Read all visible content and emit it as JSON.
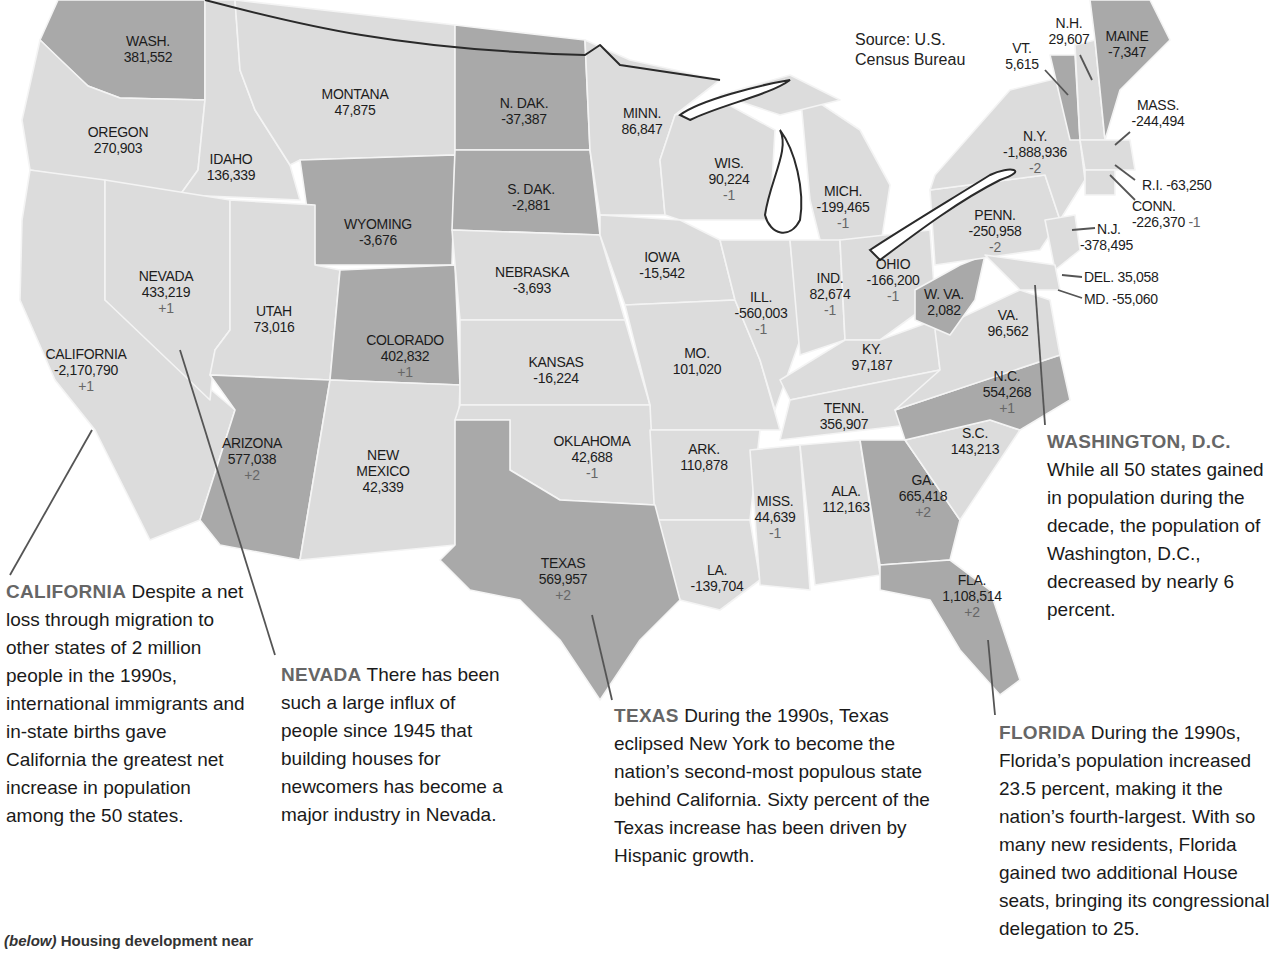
{
  "source": [
    "Source: U.S.",
    "Census Bureau"
  ],
  "colors": {
    "light_state": "#dcdcdc",
    "dark_state": "#a9a9a9",
    "caption_heading": "#666666",
    "seat_change": "#666666"
  },
  "states": [
    {
      "name": "WASH.",
      "value": "381,552",
      "seats": ""
    },
    {
      "name": "OREGON",
      "value": "270,903",
      "seats": ""
    },
    {
      "name": "IDAHO",
      "value": "136,339",
      "seats": ""
    },
    {
      "name": "MONTANA",
      "value": "47,875",
      "seats": ""
    },
    {
      "name": "WYOMING",
      "value": "-3,676",
      "seats": ""
    },
    {
      "name": "N. DAK.",
      "value": "-37,387",
      "seats": ""
    },
    {
      "name": "S. DAK.",
      "value": "-2,881",
      "seats": ""
    },
    {
      "name": "MINN.",
      "value": "86,847",
      "seats": ""
    },
    {
      "name": "WIS.",
      "value": "90,224",
      "seats": "-1"
    },
    {
      "name": "MICH.",
      "value": "-199,465",
      "seats": "-1"
    },
    {
      "name": "NEVADA",
      "value": "433,219",
      "seats": "+1"
    },
    {
      "name": "UTAH",
      "value": "73,016",
      "seats": ""
    },
    {
      "name": "COLORADO",
      "value": "402,832",
      "seats": "+1"
    },
    {
      "name": "NEBRASKA",
      "value": "-3,693",
      "seats": ""
    },
    {
      "name": "IOWA",
      "value": "-15,542",
      "seats": ""
    },
    {
      "name": "ILL.",
      "value": "-560,003",
      "seats": "-1"
    },
    {
      "name": "IND.",
      "value": "82,674",
      "seats": "-1"
    },
    {
      "name": "OHIO",
      "value": "-166,200",
      "seats": "-1"
    },
    {
      "name": "CALIFORNIA",
      "value": "-2,170,790",
      "seats": "+1"
    },
    {
      "name": "KANSAS",
      "value": "-16,224",
      "seats": ""
    },
    {
      "name": "MO.",
      "value": "101,020",
      "seats": ""
    },
    {
      "name": "KY.",
      "value": "97,187",
      "seats": ""
    },
    {
      "name": "W. VA.",
      "value": "2,082",
      "seats": ""
    },
    {
      "name": "VA.",
      "value": "96,562",
      "seats": ""
    },
    {
      "name": "ARIZONA",
      "value": "577,038",
      "seats": "+2"
    },
    {
      "name": "NEW MEXICO",
      "value": "42,339",
      "seats": ""
    },
    {
      "name": "OKLAHOMA",
      "value": "42,688",
      "seats": "-1"
    },
    {
      "name": "ARK.",
      "value": "110,878",
      "seats": ""
    },
    {
      "name": "TENN.",
      "value": "356,907",
      "seats": ""
    },
    {
      "name": "N.C.",
      "value": "554,268",
      "seats": "+1"
    },
    {
      "name": "S.C.",
      "value": "143,213",
      "seats": ""
    },
    {
      "name": "MISS.",
      "value": "44,639",
      "seats": "-1"
    },
    {
      "name": "ALA.",
      "value": "112,163",
      "seats": ""
    },
    {
      "name": "GA.",
      "value": "665,418",
      "seats": "+2"
    },
    {
      "name": "TEXAS",
      "value": "569,957",
      "seats": "+2"
    },
    {
      "name": "LA.",
      "value": "-139,704",
      "seats": ""
    },
    {
      "name": "FLA.",
      "value": "1,108,514",
      "seats": "+2"
    },
    {
      "name": "PENN.",
      "value": "-250,958",
      "seats": "-2"
    },
    {
      "name": "N.Y.",
      "value": "-1,888,936",
      "seats": "-2"
    },
    {
      "name": "VT.",
      "value": "5,615",
      "seats": ""
    },
    {
      "name": "N.H.",
      "value": "29,607",
      "seats": ""
    },
    {
      "name": "MAINE",
      "value": "-7,347",
      "seats": ""
    },
    {
      "name": "MASS.",
      "value": "-244,494",
      "seats": ""
    },
    {
      "name": "R.I.",
      "value": "-63,250",
      "seats": ""
    },
    {
      "name": "CONN.",
      "value": "-226,370",
      "seats": "-1"
    },
    {
      "name": "N.J.",
      "value": "-378,495",
      "seats": ""
    },
    {
      "name": "DEL.",
      "value": "35,058",
      "seats": ""
    },
    {
      "name": "MD.",
      "value": "-55,060",
      "seats": ""
    }
  ],
  "captions": {
    "california": {
      "heading": "CALIFORNIA",
      "text": " Despite a net loss through migration to other states of 2 million people in the 1990s, international immigrants and in-state births gave California the greatest net increase in population among the 50 states."
    },
    "nevada": {
      "heading": "NEVADA",
      "text": " There has been such a large influx of people since 1945 that building houses for newcomers has become a major industry in Nevada."
    },
    "texas": {
      "heading": "TEXAS",
      "text": " During the 1990s, Texas eclipsed New York to become the nation’s second-most populous state behind California. Sixty percent of the Texas increase has been driven by Hispanic growth."
    },
    "florida": {
      "heading": "FLORIDA",
      "text": " During the 1990s, Florida’s population increased 23.5 percent, making it the nation’s fourth-largest. With so many new residents, Florida gained two additional House seats, bringing its congressional delegation to 25."
    },
    "dc": {
      "heading": "WASHINGTON, D.C.",
      "text": "While all 50 states gained in population during the decade, the population of Washington, D.C., decreased by nearly 6 percent."
    }
  },
  "photo_caption": {
    "lead": "(below)",
    "text": " Housing development near"
  }
}
